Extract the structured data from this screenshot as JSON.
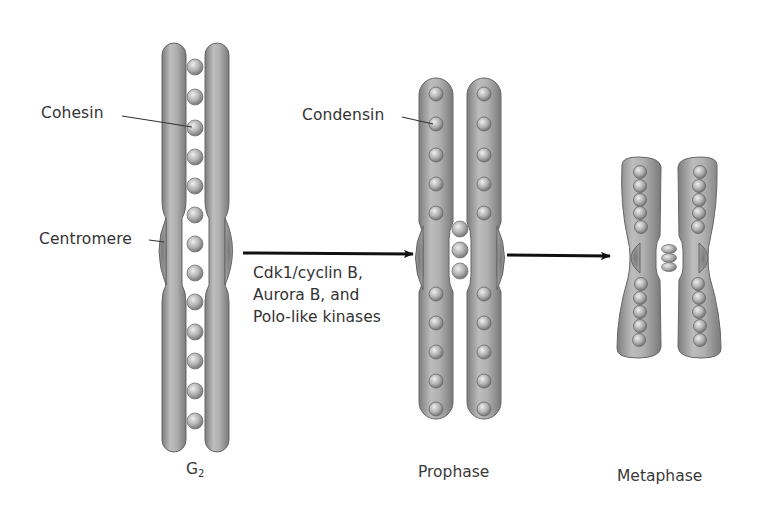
{
  "figure": {
    "labels": {
      "cohesin": "Cohesin",
      "centromere": "Centromere",
      "condensin": "Condensin"
    },
    "stages": {
      "g2_main": "G",
      "g2_sub": "2",
      "prophase": "Prophase",
      "metaphase": "Metaphase"
    },
    "transition_note": {
      "line1": "Cdk1/cyclin B,",
      "line2": "Aurora B, and",
      "line3": "Polo-like kinases"
    },
    "colors": {
      "chromatid_fill": "#a9a9a9",
      "chromatid_edge": "#6e6e6e",
      "bead_fill": "#b8b8b8",
      "centromere_fill": "#8c8c8c",
      "arrow": "#111111",
      "background": "#ffffff"
    }
  }
}
